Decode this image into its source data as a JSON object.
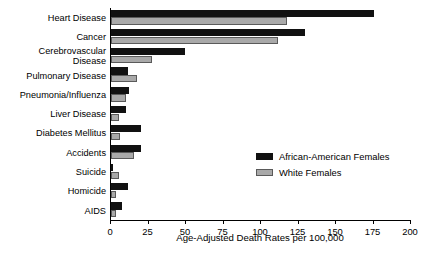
{
  "chart_data": {
    "type": "bar",
    "orientation": "horizontal",
    "title": "",
    "xlabel": "Age-Adjusted Death Rates per 100,000",
    "ylabel": "",
    "xlim": [
      0,
      200
    ],
    "xticks": [
      0,
      25,
      50,
      75,
      100,
      125,
      150,
      175,
      200
    ],
    "xtick_labels": [
      "0",
      "25",
      "50",
      "75",
      "100",
      "125",
      "150",
      "175",
      "200"
    ],
    "grid": false,
    "legend_position": "center-right",
    "categories": [
      "Heart Disease",
      "Cancer",
      "Cerebrovascular\nDisease",
      "Pulmonary Disease",
      "Pneumonia/Influenza",
      "Liver Disease",
      "Diabetes Mellitus",
      "Accidents",
      "Suicide",
      "Homicide",
      "AIDS"
    ],
    "series": [
      {
        "name": "African-American Females",
        "color": "#111111",
        "values": [
          175,
          129,
          49,
          11,
          12,
          10,
          20,
          20,
          1,
          11,
          7
        ]
      },
      {
        "name": "White Females",
        "color": "#a9a9a9",
        "values": [
          117,
          111,
          27,
          17,
          10,
          5,
          6,
          15,
          5,
          3,
          3
        ]
      }
    ]
  }
}
